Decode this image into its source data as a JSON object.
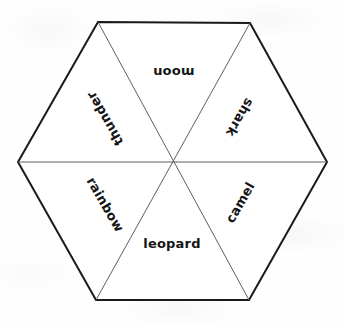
{
  "figure": {
    "kind": "hexagon-word-wheel",
    "shape_name": "hexagon",
    "wedge_count": 6,
    "background_color": "#ffffff",
    "outline_color": "#1a1a1a",
    "divider_color": "#5a5a5a",
    "text_color": "#141414",
    "outline_width_px": 2,
    "divider_width_px": 1,
    "vertices": [
      {
        "x": 98,
        "y": 22
      },
      {
        "x": 250,
        "y": 23
      },
      {
        "x": 327,
        "y": 162
      },
      {
        "x": 249,
        "y": 300
      },
      {
        "x": 96,
        "y": 300
      },
      {
        "x": 18,
        "y": 162
      }
    ],
    "center": {
      "x": 172,
      "y": 162
    }
  },
  "wedges": [
    {
      "id": "wedge-moon",
      "word": "moon",
      "position_name": "top",
      "rotation_deg": 180,
      "center": {
        "x": 174,
        "y": 72
      },
      "font_size_px": 13
    },
    {
      "id": "wedge-shark",
      "word": "shark",
      "position_name": "upper-right",
      "rotation_deg": 120,
      "center": {
        "x": 240,
        "y": 117
      },
      "font_size_px": 13
    },
    {
      "id": "wedge-camel",
      "word": "camel",
      "position_name": "lower-right",
      "rotation_deg": 300,
      "center": {
        "x": 240,
        "y": 202
      },
      "font_size_px": 13
    },
    {
      "id": "wedge-leopard",
      "word": "leopard",
      "position_name": "bottom",
      "rotation_deg": 0,
      "center": {
        "x": 172,
        "y": 243
      },
      "font_size_px": 13
    },
    {
      "id": "wedge-rainbow",
      "word": "rainbow",
      "position_name": "lower-left",
      "rotation_deg": 60,
      "center": {
        "x": 105,
        "y": 204
      },
      "font_size_px": 13
    },
    {
      "id": "wedge-thunder",
      "word": "thunder",
      "position_name": "upper-left",
      "rotation_deg": 240,
      "center": {
        "x": 105,
        "y": 118
      },
      "font_size_px": 13
    }
  ]
}
